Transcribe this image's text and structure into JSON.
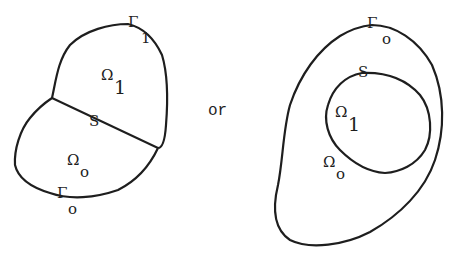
{
  "diagram": {
    "connector_text": "or",
    "stroke_color": "#1e1e1e",
    "background": "#ffffff",
    "left_figure": {
      "regions": [
        {
          "symbol": "Ω",
          "subscript": "1"
        },
        {
          "symbol": "Ω",
          "subscript": "o"
        }
      ],
      "interface": {
        "label": "S"
      },
      "boundaries": [
        {
          "symbol": "Γ",
          "subscript": "1"
        },
        {
          "symbol": "Γ",
          "subscript": "o"
        }
      ]
    },
    "right_figure": {
      "regions": [
        {
          "symbol": "Ω",
          "subscript": "1"
        },
        {
          "symbol": "Ω",
          "subscript": "o"
        }
      ],
      "interface": {
        "label": "S"
      },
      "boundaries": [
        {
          "symbol": "Γ",
          "subscript": "o"
        }
      ]
    }
  }
}
